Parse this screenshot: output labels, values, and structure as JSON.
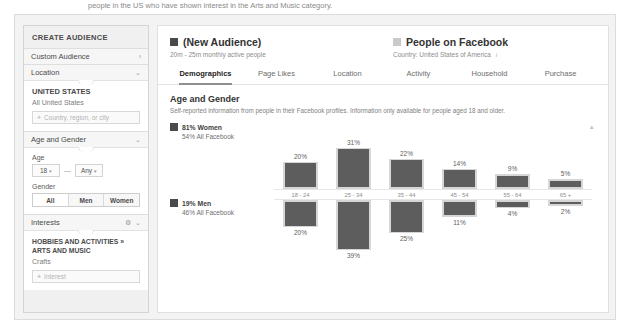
{
  "top_note": "people in the US who have shown interest in the Arts and Music category.",
  "sidebar": {
    "title": "CREATE AUDIENCE",
    "rows": [
      {
        "label": "Custom Audience",
        "chevron": "›"
      },
      {
        "label": "Location",
        "chevron": "⌄"
      }
    ],
    "location_panel": {
      "head": "UNITED STATES",
      "sub": "All United States",
      "field_plus": "+",
      "field_placeholder": "Country, region, or city"
    },
    "age_gender_row": {
      "label": "Age and Gender",
      "chevron": "⌄"
    },
    "age_gender_panel": {
      "age_label": "Age",
      "age_min": "18",
      "age_max": "Any",
      "caret": "▾",
      "dash": "—",
      "gender_label": "Gender",
      "gender_options": [
        "All",
        "Men",
        "Women"
      ],
      "gender_selected": "All"
    },
    "interests_row": {
      "label": "Interests",
      "gear": "⚙",
      "chevron": "⌄"
    },
    "interests_panel": {
      "category_line1": "HOBBIES AND ACTIVITIES »",
      "category_line2": "ARTS AND MUSIC",
      "selected": "Crafts",
      "field_plus": "+",
      "field_placeholder": "Interest"
    }
  },
  "main": {
    "audience": {
      "title": "(New Audience)",
      "subtitle": "20m - 25m monthly active people"
    },
    "comparison": {
      "title": "People on Facebook",
      "subtitle": "Country: United States of America",
      "info": "i"
    },
    "tabs": [
      {
        "label": "Demographics",
        "active": true
      },
      {
        "label": "Page Likes",
        "active": false
      },
      {
        "label": "Location",
        "active": false
      },
      {
        "label": "Activity",
        "active": false
      },
      {
        "label": "Household",
        "active": false
      },
      {
        "label": "Purchase",
        "active": false
      }
    ],
    "section": {
      "title": "Age and Gender",
      "description": "Self-reported information from people in their Facebook profiles. Information only available for people aged 18 and older."
    },
    "scroll_caret": "▴",
    "colors": {
      "selected_audience": "#5d5d5d",
      "all_facebook": "#d6d6d6"
    }
  },
  "chart_data": {
    "type": "bar",
    "title": "Age and Gender",
    "categories": [
      "18 - 24",
      "25 - 34",
      "35 - 44",
      "45 - 54",
      "55 - 64",
      "65 +"
    ],
    "xlabel": "",
    "ylabel": "",
    "grid": false,
    "legend_position": "left",
    "groups": [
      {
        "name": "Women",
        "direction": "up",
        "audience_share": "81% Women",
        "benchmark_share": "54% All Facebook",
        "series": [
          {
            "name": "(New Audience)",
            "color": "#5d5d5d",
            "values": [
              20,
              31,
              22,
              14,
              9,
              5
            ],
            "labels": [
              "20%",
              "31%",
              "22%",
              "14%",
              "9%",
              "5%"
            ]
          },
          {
            "name": "People on Facebook",
            "color": "#d6d6d6",
            "values": [
              22,
              33,
              24,
              16,
              12,
              8
            ]
          }
        ]
      },
      {
        "name": "Men",
        "direction": "down",
        "audience_share": "19% Men",
        "benchmark_share": "46% All Facebook",
        "series": [
          {
            "name": "(New Audience)",
            "color": "#5d5d5d",
            "values": [
              20,
              39,
              25,
              11,
              4,
              2
            ],
            "labels": [
              "20%",
              "39%",
              "25%",
              "11%",
              "4%",
              "2%"
            ]
          },
          {
            "name": "People on Facebook",
            "color": "#d6d6d6",
            "values": [
              22,
              33,
              27,
              14,
              7,
              5
            ]
          }
        ]
      }
    ]
  }
}
